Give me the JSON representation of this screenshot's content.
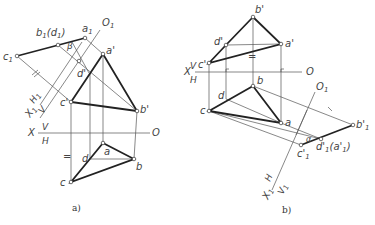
{
  "figure_a": {
    "caption": "a)",
    "axis_x": {
      "label": "X",
      "upper": "V",
      "lower": "H",
      "end": "O"
    },
    "axis_x1": {
      "label": "X",
      "label_sub": "1",
      "upper": "H",
      "upper_sub": "1",
      "lower": "V",
      "end": "O",
      "end_sub": "1"
    },
    "points": {
      "c1": "c",
      "c1_sub": "1",
      "b1d1": "b",
      "b1d1_sub": "1",
      "b1d1_paren": "(d",
      "b1d1_paren_sub": "1",
      "b1d1_close": ")",
      "a1": "a",
      "a1_sub": "1",
      "a_prime": "a'",
      "b_prime": "b'",
      "c_prime": "c'",
      "d_prime": "d'",
      "a": "a",
      "b": "b",
      "c": "c",
      "d": "d"
    },
    "angle": "β",
    "equal_mark": "="
  },
  "figure_b": {
    "caption": "b)",
    "axis_x": {
      "label": "X",
      "upper": "V",
      "lower": "H",
      "end": "O"
    },
    "axis_x1": {
      "label": "X",
      "label_sub": "1",
      "upper": "H",
      "lower": "V",
      "lower_sub": "1",
      "end": "O",
      "end_sub": "1"
    },
    "points": {
      "b_prime": "b'",
      "a_prime": "a'",
      "c_prime": "c'",
      "d_prime": "d'",
      "a": "a",
      "b": "b",
      "c": "c",
      "d": "d",
      "b1_prime": "b'",
      "b1_prime_sub": "1",
      "c1_prime": "c'",
      "c1_prime_sub": "1",
      "d1a1": "d'",
      "d1a1_sub": "1",
      "d1a1_paren": "(a'",
      "d1a1_paren_sub": "1",
      "d1a1_close": ")"
    },
    "angle": "α",
    "equal_mark": "="
  }
}
